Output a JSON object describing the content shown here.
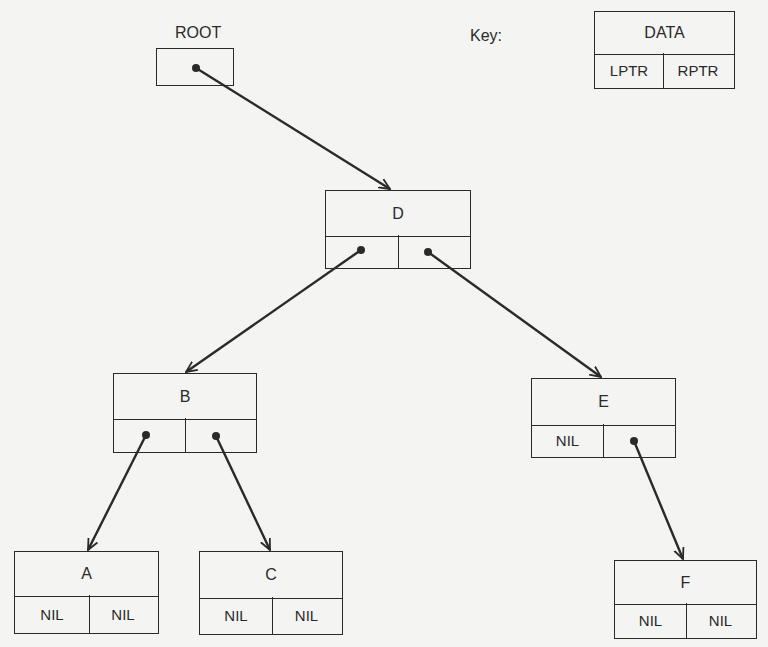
{
  "diagram": {
    "type": "binary-tree-linked-representation",
    "root_label": "ROOT",
    "key": {
      "label": "Key:",
      "data": "DATA",
      "left": "LPTR",
      "right": "RPTR"
    },
    "nodes": {
      "D": {
        "data": "D",
        "left": "",
        "right": ""
      },
      "B": {
        "data": "B",
        "left": "",
        "right": ""
      },
      "E": {
        "data": "E",
        "left": "NIL",
        "right": ""
      },
      "A": {
        "data": "A",
        "left": "NIL",
        "right": "NIL"
      },
      "C": {
        "data": "C",
        "left": "NIL",
        "right": "NIL"
      },
      "F": {
        "data": "F",
        "left": "NIL",
        "right": "NIL"
      }
    },
    "edges": [
      {
        "from": "ROOT",
        "to": "D"
      },
      {
        "from": "D.left",
        "to": "B"
      },
      {
        "from": "D.right",
        "to": "E"
      },
      {
        "from": "B.left",
        "to": "A"
      },
      {
        "from": "B.right",
        "to": "C"
      },
      {
        "from": "E.right",
        "to": "F"
      }
    ],
    "colors": {
      "ink": "#2a2a2a",
      "paper": "#f4f4f2"
    }
  }
}
